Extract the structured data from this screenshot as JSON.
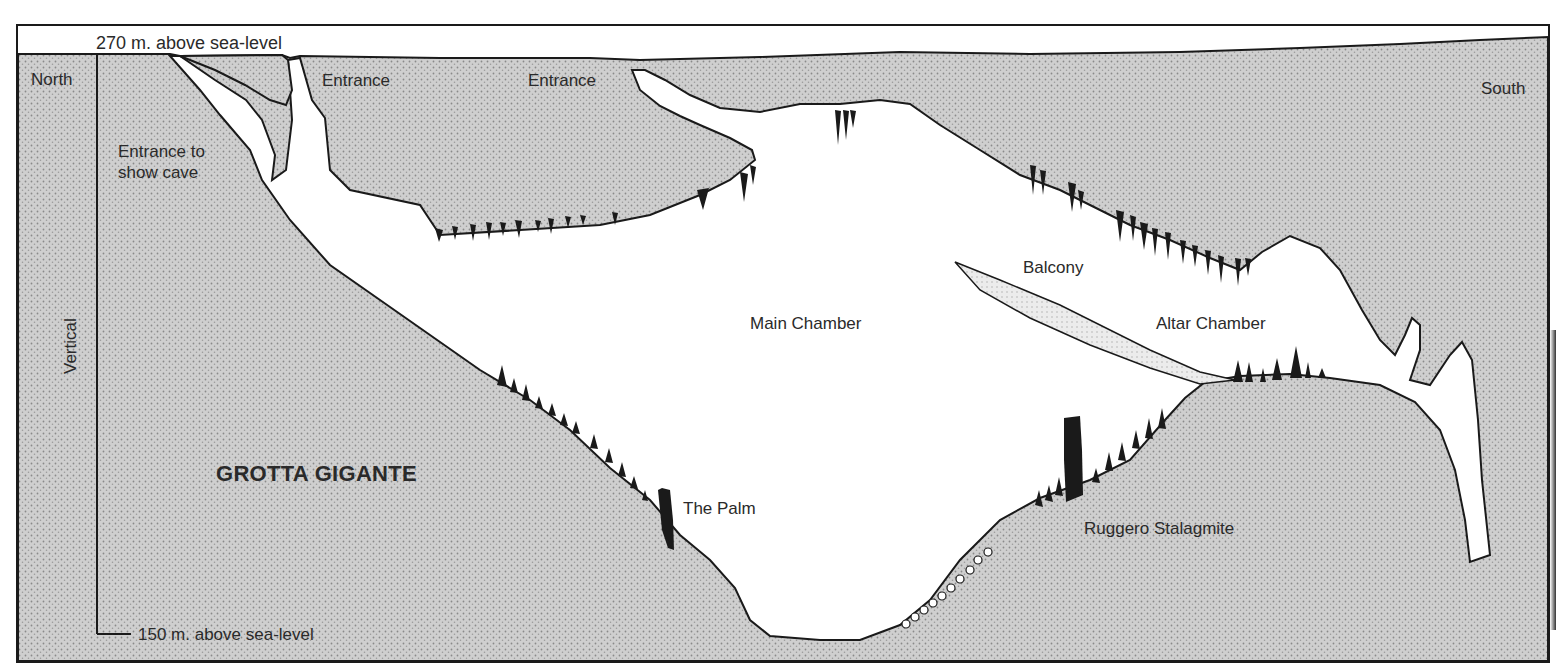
{
  "diagram": {
    "title": "GROTTA GIGANTE",
    "type": "cave cross-section",
    "colors": {
      "rock_fill": "#c9c9c9",
      "outline": "#1a1a1a",
      "speleothem": "#1a1a1a",
      "cave_void": "#ffffff"
    },
    "scale": {
      "axis_label": "Vertical",
      "top": "270 m. above sea-level",
      "bottom": "150 m. above sea-level"
    },
    "orientation": {
      "left": "North",
      "right": "South"
    },
    "labels": {
      "entrance_show_cave_line1": "Entrance to",
      "entrance_show_cave_line2": "show cave",
      "entrance_1": "Entrance",
      "entrance_2": "Entrance",
      "main_chamber": "Main Chamber",
      "balcony": "Balcony",
      "altar_chamber": "Altar Chamber",
      "the_palm": "The Palm",
      "ruggero_stalagmite": "Ruggero Stalagmite"
    }
  }
}
